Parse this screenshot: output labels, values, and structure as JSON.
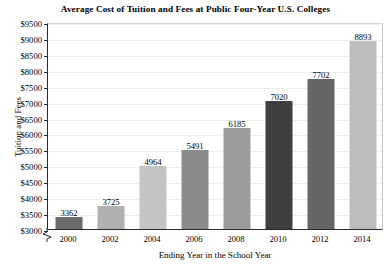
{
  "chart_data": {
    "type": "bar",
    "title": "Average Cost of Tuition and Fees at Public Four-Year U.S. Colleges",
    "xlabel": "Ending Year in the School Year",
    "ylabel": "Tuition and Fees",
    "categories": [
      "2000",
      "2002",
      "2004",
      "2006",
      "2008",
      "2010",
      "2012",
      "2014"
    ],
    "values": [
      3362,
      3725,
      4964,
      5491,
      6185,
      7020,
      7702,
      8893
    ],
    "value_labels": [
      "3362",
      "3725",
      "4964",
      "5491",
      "6185",
      "7020",
      "7702",
      "8893"
    ],
    "bar_colors": [
      "#6b6b6b",
      "#b0b0b0",
      "#c4c4c4",
      "#8a8a8a",
      "#9b9b9b",
      "#3f3f3f",
      "#666666",
      "#bdbdbd"
    ],
    "ylim": [
      3000,
      9500
    ],
    "ytick_values": [
      3000,
      3500,
      4000,
      4500,
      5000,
      5500,
      6000,
      6500,
      7000,
      7500,
      8000,
      8500,
      9000,
      9500
    ],
    "ytick_labels": [
      "$3000",
      "$3500",
      "$4000",
      "$4500",
      "$5000",
      "$5500",
      "$6000",
      "$6500",
      "$7000",
      "$7500",
      "$8000",
      "$8500",
      "$9000",
      "$9500"
    ],
    "grid": true,
    "grid_axis": "y",
    "legend": false,
    "axis_break": true,
    "background_color": "#ffffff",
    "axis_color": "#2b2b2b",
    "gridline_color": "#ededed"
  }
}
